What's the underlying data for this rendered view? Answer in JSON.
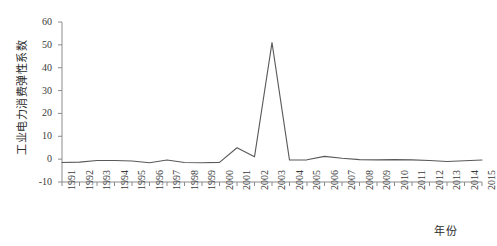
{
  "chart_data": {
    "type": "line",
    "title": "",
    "xlabel": "年份",
    "ylabel": "工业电力消费弹性系数",
    "x": [
      1991,
      1992,
      1993,
      1994,
      1995,
      1996,
      1997,
      1998,
      1999,
      2000,
      2001,
      2002,
      2003,
      2004,
      2005,
      2006,
      2007,
      2008,
      2009,
      2010,
      2011,
      2012,
      2013,
      2014,
      2015
    ],
    "values": [
      -1.5,
      -1.3,
      -0.6,
      -0.6,
      -0.8,
      -1.6,
      -0.4,
      -1.5,
      -1.6,
      -1.4,
      5.0,
      1.0,
      51.0,
      -0.4,
      -0.3,
      1.2,
      0.4,
      -0.2,
      -0.3,
      -0.2,
      -0.3,
      -0.6,
      -1.0,
      -0.7,
      -0.4
    ],
    "series_name": "工业电力消费弹性系数",
    "xlim": [
      1991,
      2015
    ],
    "ylim": [
      -10,
      60
    ],
    "yticks": [
      -10,
      0,
      10,
      20,
      30,
      40,
      50,
      60
    ],
    "ytick_labels": [
      "-10",
      "0",
      "10",
      "20",
      "30",
      "40",
      "50",
      "60"
    ],
    "xticks": [
      1991,
      1992,
      1993,
      1994,
      1995,
      1996,
      1997,
      1998,
      1999,
      2000,
      2001,
      2002,
      2003,
      2004,
      2005,
      2006,
      2007,
      2008,
      2009,
      2010,
      2011,
      2012,
      2013,
      2014,
      2015
    ],
    "xtick_labels": [
      "1991",
      "1992",
      "1993",
      "1994",
      "1995",
      "1996",
      "1997",
      "1998",
      "1999",
      "2000",
      "2001",
      "2002",
      "2003",
      "2004",
      "2005",
      "2006",
      "2007",
      "2008",
      "2009",
      "2010",
      "2011",
      "2012",
      "2013",
      "2014",
      "2015"
    ],
    "grid": false,
    "legend": false,
    "line_color": "#595959",
    "axis_color": "#8c8c8c",
    "background": "#ffffff",
    "peak": {
      "year": 2003,
      "value": 51.0
    }
  }
}
